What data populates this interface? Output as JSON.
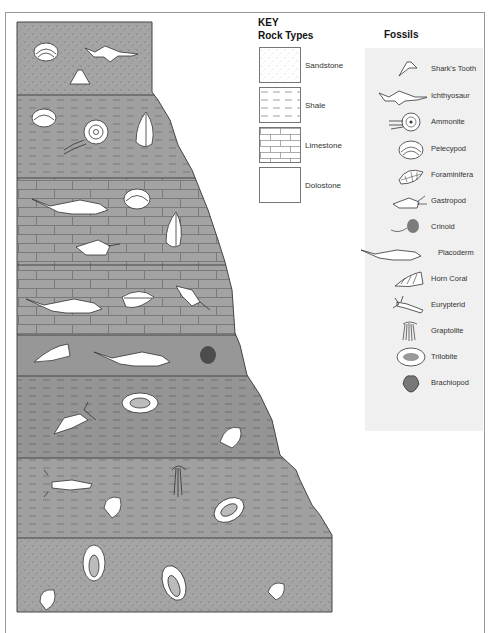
{
  "key": {
    "title": "KEY",
    "rock_types_title": "Rock Types",
    "rock_types": [
      {
        "name": "Sandstone",
        "pattern": "dots"
      },
      {
        "name": "Shale",
        "pattern": "dashes"
      },
      {
        "name": "Limestone",
        "pattern": "bricks"
      },
      {
        "name": "Dolostone",
        "pattern": "plain"
      }
    ],
    "fossils_title": "Fossils",
    "fossils": [
      {
        "name": "Shark's Tooth",
        "icon": "shark-tooth-icon"
      },
      {
        "name": "Ichthyosaur",
        "icon": "ichthyosaur-icon"
      },
      {
        "name": "Ammonite",
        "icon": "ammonite-icon"
      },
      {
        "name": "Pelecypod",
        "icon": "pelecypod-icon"
      },
      {
        "name": "Foraminifera",
        "icon": "foraminifera-icon"
      },
      {
        "name": "Gastropod",
        "icon": "gastropod-icon"
      },
      {
        "name": "Crinoid",
        "icon": "crinoid-icon"
      },
      {
        "name": "Placoderm",
        "icon": "placoderm-icon"
      },
      {
        "name": "Horn Coral",
        "icon": "horn-coral-icon"
      },
      {
        "name": "Eurypterid",
        "icon": "eurypterid-icon"
      },
      {
        "name": "Graptolite",
        "icon": "graptolite-icon"
      },
      {
        "name": "Trilobite",
        "icon": "trilobite-icon"
      },
      {
        "name": "Brachiopod",
        "icon": "brachiopod-icon"
      }
    ]
  },
  "column": {
    "layers": [
      {
        "rock": "Sandstone",
        "fossils": [
          "Pelecypod",
          "Ichthyosaur",
          "Shark's Tooth"
        ]
      },
      {
        "rock": "Shale",
        "fossils": [
          "Pelecypod",
          "Ammonite",
          "Foraminifera"
        ]
      },
      {
        "rock": "Limestone",
        "fossils": [
          "Placoderm",
          "Pelecypod",
          "Foraminifera",
          "Gastropod"
        ]
      },
      {
        "rock": "Limestone",
        "fossils": [
          "Placoderm",
          "Foraminifera",
          "Gastropod"
        ]
      },
      {
        "rock": "Dolostone",
        "fossils": [
          "Horn Coral",
          "Placoderm",
          "Crinoid"
        ]
      },
      {
        "rock": "Shale",
        "fossils": [
          "Trilobite",
          "Eurypterid",
          "Brachiopod"
        ]
      },
      {
        "rock": "Shale",
        "fossils": [
          "Eurypterid",
          "Graptolite",
          "Brachiopod",
          "Trilobite"
        ]
      },
      {
        "rock": "Sandstone",
        "fossils": [
          "Trilobite",
          "Trilobite",
          "Brachiopod",
          "Brachiopod"
        ]
      }
    ]
  },
  "colors": {
    "rock_fill_dark": "#8f8f8f",
    "rock_fill": "#a3a3a3",
    "panel_bg": "#f0f0f0",
    "outline": "#444444"
  }
}
